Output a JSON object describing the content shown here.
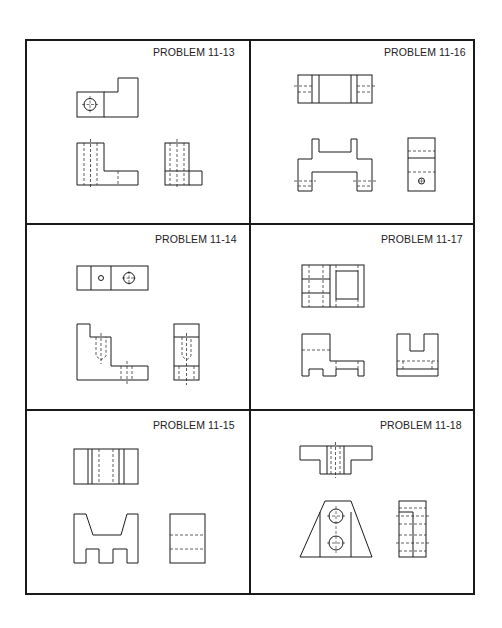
{
  "sheet": {
    "line_color": "#1a1a1a",
    "background": "#ffffff"
  },
  "panels": [
    {
      "id": "p1113",
      "title": "PROBLEM 11-13",
      "position": "row1-left",
      "views": [
        "top",
        "front",
        "right-side"
      ]
    },
    {
      "id": "p1116",
      "title": "PROBLEM 11-16",
      "position": "row1-right",
      "views": [
        "top",
        "front",
        "right-side"
      ]
    },
    {
      "id": "p1114",
      "title": "PROBLEM 11-14",
      "position": "row2-left",
      "views": [
        "top",
        "front",
        "right-side"
      ]
    },
    {
      "id": "p1117",
      "title": "PROBLEM 11-17",
      "position": "row2-right",
      "views": [
        "top",
        "front",
        "right-side"
      ]
    },
    {
      "id": "p1115",
      "title": "PROBLEM 11-15",
      "position": "row3-left",
      "views": [
        "top",
        "front",
        "right-side"
      ]
    },
    {
      "id": "p1118",
      "title": "PROBLEM 11-18",
      "position": "row3-right",
      "views": [
        "top",
        "front",
        "right-side"
      ]
    }
  ]
}
